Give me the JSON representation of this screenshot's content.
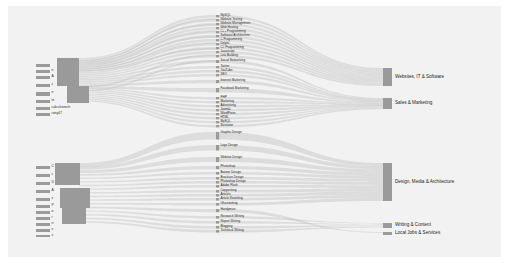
{
  "chart_data": {
    "type": "sankey",
    "title": "",
    "xlabel": "",
    "ylabel": "",
    "legend": "none",
    "grid": false,
    "background_color": "#f2f2f2",
    "node_color": "#9a9a9a",
    "link_color": "#b4b4b4",
    "columns": [
      {
        "name": "freelancers",
        "x": 0.08
      },
      {
        "name": "skills",
        "x": 0.44
      },
      {
        "name": "categories",
        "x": 0.78
      }
    ],
    "nodes_left": [
      {
        "label": "",
        "y": 64,
        "h": 3,
        "w": 14
      },
      {
        "label": "n",
        "y": 70,
        "h": 3,
        "w": 14
      },
      {
        "label": "A",
        "y": 76,
        "h": 3,
        "w": 14
      },
      {
        "label": "c",
        "y": 84,
        "h": 3,
        "w": 14
      },
      {
        "label": "n",
        "y": 92,
        "h": 4,
        "w": 14
      },
      {
        "label": "te",
        "y": 100,
        "h": 3,
        "w": 14
      },
      {
        "label": "calculustech",
        "y": 107,
        "h": 3,
        "w": 14
      },
      {
        "label": "rony47",
        "y": 113,
        "h": 3,
        "w": 14
      },
      {
        "label": "C",
        "y": 166,
        "h": 3,
        "w": 14
      },
      {
        "label": "c",
        "y": 174,
        "h": 3,
        "w": 14
      },
      {
        "label": "D",
        "y": 182,
        "h": 3,
        "w": 14
      },
      {
        "label": "A",
        "y": 190,
        "h": 3,
        "w": 14
      },
      {
        "label": "s",
        "y": 198,
        "h": 3,
        "w": 14
      },
      {
        "label": "P",
        "y": 205,
        "h": 3,
        "w": 14
      },
      {
        "label": "o",
        "y": 211,
        "h": 3,
        "w": 14
      },
      {
        "label": "r",
        "y": 217,
        "h": 3,
        "w": 14
      },
      {
        "label": "n",
        "y": 223,
        "h": 3,
        "w": 14
      },
      {
        "label": "s",
        "y": 229,
        "h": 3,
        "w": 14
      },
      {
        "label": "v",
        "y": 235,
        "h": 2,
        "w": 14
      }
    ],
    "nodes_mid": [
      {
        "label": "MySQL",
        "y": 15,
        "h": 2.4
      },
      {
        "label": "Website Testing",
        "y": 19,
        "h": 2.4
      },
      {
        "label": "Website Management",
        "y": 23,
        "h": 2.4
      },
      {
        "label": "Web Hosting",
        "y": 27,
        "h": 2.4
      },
      {
        "label": "C++ Programming",
        "y": 31,
        "h": 2.4
      },
      {
        "label": "Software Architecture",
        "y": 35,
        "h": 2.4
      },
      {
        "label": "C Programming",
        "y": 39,
        "h": 2.4
      },
      {
        "label": "Delphi",
        "y": 43,
        "h": 2.4
      },
      {
        "label": "C# Programming",
        "y": 47,
        "h": 2.4
      },
      {
        "label": "Javascript",
        "y": 51,
        "h": 2.4
      },
      {
        "label": "Link Building",
        "y": 55,
        "h": 2.4
      },
      {
        "label": "Social Networking",
        "y": 60,
        "h": 3.0
      },
      {
        "label": "Twitter",
        "y": 66,
        "h": 2.4
      },
      {
        "label": "YouTube",
        "y": 70,
        "h": 2.4
      },
      {
        "label": "SEO",
        "y": 74,
        "h": 2.4
      },
      {
        "label": "Internet Marketing",
        "y": 80,
        "h": 3.2
      },
      {
        "label": "Facebook Marketing",
        "y": 88,
        "h": 4.4
      },
      {
        "label": "PHP",
        "y": 97,
        "h": 2.4
      },
      {
        "label": "Marketing",
        "y": 101,
        "h": 2.4
      },
      {
        "label": "Advertising",
        "y": 105,
        "h": 2.4
      },
      {
        "label": "Joomla",
        "y": 109,
        "h": 2.4
      },
      {
        "label": "WordPress",
        "y": 113,
        "h": 2.4
      },
      {
        "label": "HTML",
        "y": 117,
        "h": 2.4
      },
      {
        "label": "MySQL",
        "y": 121,
        "h": 2.4
      },
      {
        "label": "Illustrator",
        "y": 125,
        "h": 2.4
      },
      {
        "label": "Graphic Design",
        "y": 132,
        "h": 7.5
      },
      {
        "label": "Logo Design",
        "y": 145,
        "h": 5.5
      },
      {
        "label": "Website Design",
        "y": 157,
        "h": 5.0
      },
      {
        "label": "Photoshop",
        "y": 166,
        "h": 3.2
      },
      {
        "label": "Banner Design",
        "y": 172,
        "h": 2.6
      },
      {
        "label": "Brochure Design",
        "y": 177,
        "h": 2.6
      },
      {
        "label": "Photoshop Design",
        "y": 181,
        "h": 2.6
      },
      {
        "label": "Adobe Flash",
        "y": 185,
        "h": 2.6
      },
      {
        "label": "Copywriting",
        "y": 190,
        "h": 2.6
      },
      {
        "label": "Articles",
        "y": 194,
        "h": 2.6
      },
      {
        "label": "Article Rewriting",
        "y": 198,
        "h": 2.6
      },
      {
        "label": "Ghostwriting",
        "y": 203,
        "h": 2.6
      },
      {
        "label": "Handyman",
        "y": 209,
        "h": 3.2
      },
      {
        "label": "Research Writing",
        "y": 216,
        "h": 2.6
      },
      {
        "label": "Report Writing",
        "y": 221,
        "h": 2.6
      },
      {
        "label": "Blogging",
        "y": 226,
        "h": 2.6
      },
      {
        "label": "Technical Writing",
        "y": 230,
        "h": 2.6
      }
    ],
    "nodes_right": [
      {
        "label": "Websites, IT & Software",
        "y": 68,
        "h": 18
      },
      {
        "label": "Sales & Marketing",
        "y": 98,
        "h": 11
      },
      {
        "label": "Design, Media & Architecture",
        "y": 163,
        "h": 38
      },
      {
        "label": "Writing & Content",
        "y": 223,
        "h": 5
      },
      {
        "label": "Local Jobs & Services",
        "y": 232,
        "h": 3
      }
    ]
  }
}
